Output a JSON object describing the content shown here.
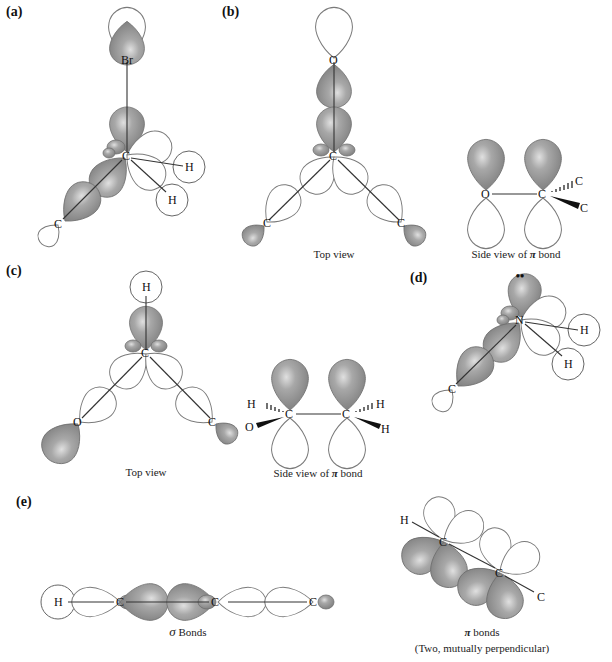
{
  "figure": {
    "colors": {
      "background": "#ffffff",
      "shaded_lobe": "#8f8f8f",
      "shaded_highlight": "#d8d8d8",
      "outline": "#7a7a7a",
      "bond_line": "#333333"
    },
    "panels": {
      "a": {
        "label": "(a)",
        "atoms": {
          "top": "Br",
          "center": "C",
          "h1": "H",
          "h2": "H",
          "bottom": "C"
        }
      },
      "b": {
        "label": "(b)",
        "top_view": {
          "atoms": {
            "top": "O",
            "center": "C",
            "left": "C",
            "right": "C"
          },
          "caption": "Top view"
        },
        "side_view": {
          "atoms": {
            "left": "O",
            "right": "C",
            "wedge_up": "C",
            "wedge_down": "C"
          },
          "caption_prefix": "Side view of ",
          "caption_symbol": "π",
          "caption_suffix": " bond"
        }
      },
      "c": {
        "label": "(c)",
        "top_view": {
          "atoms": {
            "top": "H",
            "center": "C",
            "left": "O",
            "right": "C"
          },
          "caption": "Top view"
        },
        "side_view": {
          "atoms": {
            "h_left": "H",
            "o_left": "O",
            "c_left": "C",
            "c_right": "C",
            "h_right_up": "H",
            "h_right_down": "H"
          },
          "caption_prefix": "Side view of ",
          "caption_symbol": "π",
          "caption_suffix": " bond"
        }
      },
      "d": {
        "label": "(d)",
        "atoms": {
          "center": "N",
          "h1": "H",
          "h2": "H",
          "bottom": "C"
        },
        "lone_pair": "••"
      },
      "e": {
        "label": "(e)",
        "sigma": {
          "atoms": {
            "h": "H",
            "c1": "C",
            "c2": "C",
            "c3": "C"
          },
          "caption_symbol": "σ",
          "caption_suffix": " Bonds"
        },
        "pi": {
          "atoms": {
            "h": "H",
            "c1": "C",
            "c2": "C",
            "c3": "C"
          },
          "caption_symbol": "π",
          "caption_suffix": " bonds",
          "caption_line2": "(Two, mutually perpendicular)"
        }
      }
    }
  }
}
